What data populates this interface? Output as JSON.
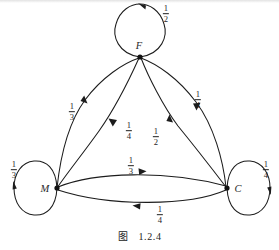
{
  "figure": {
    "caption_word": "图",
    "caption_number": "1.2.4",
    "type": "directed-graph"
  },
  "nodes": [
    {
      "id": "F",
      "label": "F",
      "x": 140,
      "y": 57,
      "label_x": 139,
      "label_y": 45
    },
    {
      "id": "M",
      "label": "M",
      "x": 57,
      "y": 188,
      "label_x": 45,
      "label_y": 188
    },
    {
      "id": "C",
      "label": "C",
      "x": 227,
      "y": 188,
      "label_x": 238,
      "label_y": 188
    }
  ],
  "self_loops": [
    {
      "node": "F",
      "label_num": "1",
      "label_den": "2",
      "label_x": 166,
      "label_y": 14,
      "arrow_direction": "counterclockwise-top"
    },
    {
      "node": "M",
      "label_num": "1",
      "label_den": "3",
      "label_x": 14,
      "label_y": 170,
      "arrow_direction": "counterclockwise-left"
    },
    {
      "node": "C",
      "label_num": "1",
      "label_den": "4",
      "label_x": 266,
      "label_y": 170,
      "arrow_direction": "clockwise-right"
    }
  ],
  "edges": [
    {
      "from": "M",
      "to": "F",
      "label_num": "1",
      "label_den": "3",
      "label_x": 72,
      "label_y": 112,
      "side": "outer-left"
    },
    {
      "from": "F",
      "to": "M",
      "label_num": "1",
      "label_den": "4",
      "label_x": 129,
      "label_y": 131,
      "side": "inner-left"
    },
    {
      "from": "F",
      "to": "C",
      "label_num": "1",
      "label_den": "4",
      "label_x": 198,
      "label_y": 100,
      "side": "outer-right"
    },
    {
      "from": "C",
      "to": "F",
      "label_num": "1",
      "label_den": "2",
      "label_x": 156,
      "label_y": 137,
      "side": "inner-right"
    },
    {
      "from": "M",
      "to": "C",
      "label_num": "1",
      "label_den": "3",
      "label_x": 131,
      "label_y": 166,
      "side": "upper"
    },
    {
      "from": "C",
      "to": "M",
      "label_num": "1",
      "label_den": "4",
      "label_x": 160,
      "label_y": 215,
      "side": "lower"
    }
  ],
  "style": {
    "stroke_color": "#1c1c1c",
    "background": "#ffffff",
    "text_color": "#1f1f1f"
  }
}
